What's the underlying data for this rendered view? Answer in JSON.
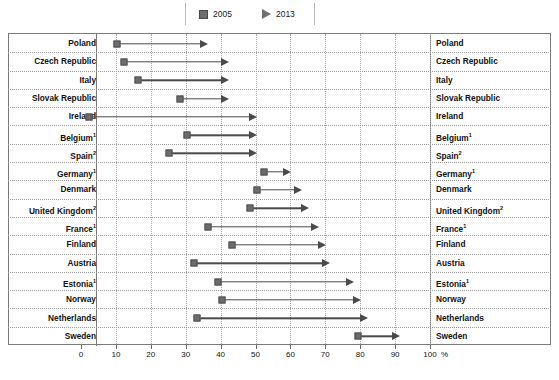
{
  "legend": {
    "items": [
      {
        "label": "2005",
        "icon": "square-marker-icon",
        "color": "#6e6e6e"
      },
      {
        "label": "2013",
        "icon": "triangle-marker-icon",
        "color": "#6e6e6e"
      }
    ]
  },
  "axis": {
    "ticks": [
      "0",
      "10",
      "20",
      "30",
      "40",
      "50",
      "60",
      "70",
      "80",
      "90",
      "100"
    ],
    "unit": "%"
  },
  "chart_data": {
    "type": "bar",
    "subtype": "dumbbell-arrow-range",
    "title": "",
    "xlabel": "%",
    "ylabel": "",
    "xlim": [
      0,
      100
    ],
    "grid": true,
    "legend_position": "top-center",
    "series": [
      {
        "name": "2005",
        "marker": "square"
      },
      {
        "name": "2013",
        "marker": "arrow"
      }
    ],
    "categories": [
      "Poland",
      "Czech Republic",
      "Italy",
      "Slovak Republic",
      "Ireland",
      "Belgium",
      "Spain",
      "Germany",
      "Denmark",
      "United Kingdom",
      "France",
      "Finland",
      "Austria",
      "Estonia",
      "Norway",
      "Netherlands",
      "Sweden"
    ],
    "rows": [
      {
        "label": "Poland",
        "footnote": "",
        "v2005": 8,
        "v2013": 34
      },
      {
        "label": "Czech Republic",
        "footnote": "",
        "v2005": 10,
        "v2013": 40
      },
      {
        "label": "Italy",
        "footnote": "",
        "v2005": 14,
        "v2013": 40
      },
      {
        "label": "Slovak Republic",
        "footnote": "",
        "v2005": 26,
        "v2013": 40
      },
      {
        "label": "Ireland",
        "footnote": "",
        "v2005": 0,
        "v2013": 48
      },
      {
        "label": "Belgium",
        "footnote": "1",
        "v2005": 28,
        "v2013": 48
      },
      {
        "label": "Spain",
        "footnote": "2",
        "v2005": 23,
        "v2013": 48
      },
      {
        "label": "Germany",
        "footnote": "1",
        "v2005": 50,
        "v2013": 58
      },
      {
        "label": "Denmark",
        "footnote": "",
        "v2005": 48,
        "v2013": 61
      },
      {
        "label": "United Kingdom",
        "footnote": "2",
        "v2005": 46,
        "v2013": 63
      },
      {
        "label": "France",
        "footnote": "1",
        "v2005": 34,
        "v2013": 66
      },
      {
        "label": "Finland",
        "footnote": "",
        "v2005": 41,
        "v2013": 68
      },
      {
        "label": "Austria",
        "footnote": "",
        "v2005": 30,
        "v2013": 69
      },
      {
        "label": "Estonia",
        "footnote": "1",
        "v2005": 37,
        "v2013": 76
      },
      {
        "label": "Norway",
        "footnote": "",
        "v2005": 38,
        "v2013": 78
      },
      {
        "label": "Netherlands",
        "footnote": "",
        "v2005": 31,
        "v2013": 80
      },
      {
        "label": "Sweden",
        "footnote": "",
        "v2005": 77,
        "v2013": 89
      }
    ]
  }
}
